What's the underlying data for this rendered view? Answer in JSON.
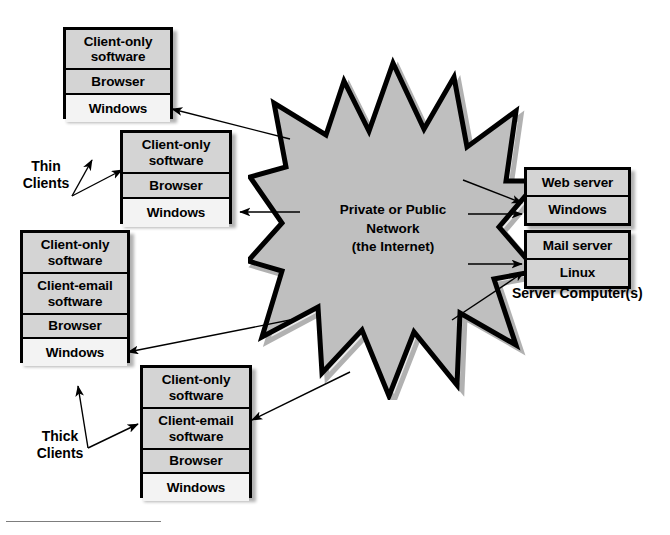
{
  "diagram": {
    "colors": {
      "box_fill": "#d4d4d4",
      "box_fill_light": "#f3f3f3",
      "star_fill": "#bfbfbf",
      "outline": "#000000",
      "shadow": "rgba(0,0,0,0.30)",
      "footnote_rule": "#7d7d7d"
    },
    "network": {
      "shape": "star-burst",
      "text": "Private or Public\nNetwork\n(the Internet)"
    },
    "groups": {
      "thin_clients_label": "Thin\nClients",
      "thick_clients_label": "Thick\nClients",
      "servers_label": "Server Computer(s)"
    },
    "clients": [
      {
        "name": "thin-client-1",
        "type": "thin",
        "rows": [
          {
            "text": "Client-only\nsoftware",
            "shade": "gray"
          },
          {
            "text": "Browser",
            "shade": "gray"
          },
          {
            "text": "Windows",
            "shade": "light"
          }
        ]
      },
      {
        "name": "thin-client-2",
        "type": "thin",
        "rows": [
          {
            "text": "Client-only\nsoftware",
            "shade": "gray"
          },
          {
            "text": "Browser",
            "shade": "gray"
          },
          {
            "text": "Windows",
            "shade": "light"
          }
        ]
      },
      {
        "name": "thick-client-1",
        "type": "thick",
        "rows": [
          {
            "text": "Client-only\nsoftware",
            "shade": "gray"
          },
          {
            "text": "Client-email\nsoftware",
            "shade": "gray"
          },
          {
            "text": "Browser",
            "shade": "gray"
          },
          {
            "text": "Windows",
            "shade": "light"
          }
        ]
      },
      {
        "name": "thick-client-2",
        "type": "thick",
        "rows": [
          {
            "text": "Client-only\nsoftware",
            "shade": "gray"
          },
          {
            "text": "Client-email\nsoftware",
            "shade": "gray"
          },
          {
            "text": "Browser",
            "shade": "gray"
          },
          {
            "text": "Windows",
            "shade": "light"
          }
        ]
      }
    ],
    "servers": [
      {
        "name": "web-server",
        "rows": [
          {
            "text": "Web server",
            "shade": "gray"
          },
          {
            "text": "Windows",
            "shade": "gray"
          }
        ]
      },
      {
        "name": "mail-server",
        "rows": [
          {
            "text": "Mail server",
            "shade": "gray"
          },
          {
            "text": "Linux",
            "shade": "gray"
          }
        ]
      }
    ],
    "connections": [
      {
        "from": "network",
        "to": "thin-client-1",
        "target_row": "Windows"
      },
      {
        "from": "network",
        "to": "thin-client-2",
        "target_row": "Windows"
      },
      {
        "from": "network",
        "to": "thick-client-1",
        "target_row": "Windows"
      },
      {
        "from": "network",
        "to": "thick-client-2",
        "target_row": "Client-email software"
      },
      {
        "from": "network",
        "to": "web-server",
        "target_row": "Windows"
      },
      {
        "from": "network",
        "to": "web-server",
        "target_row": "Windows"
      },
      {
        "from": "network",
        "to": "mail-server",
        "target_row": "Linux"
      },
      {
        "from": "network",
        "to": "mail-server",
        "target_row": "Linux"
      }
    ]
  }
}
